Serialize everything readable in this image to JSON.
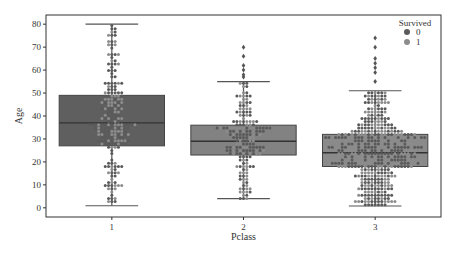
{
  "chart_data": {
    "type": "box",
    "overlay": "swarm",
    "title": "",
    "xlabel": "Pclass",
    "ylabel": "Age",
    "categories": [
      "1",
      "2",
      "3"
    ],
    "ylim": [
      -4,
      84
    ],
    "yticks": [
      0,
      10,
      20,
      30,
      40,
      50,
      60,
      70,
      80
    ],
    "grid": false,
    "boxes": [
      {
        "category": "1",
        "whisker_low": 0.9,
        "q1": 27,
        "median": 37,
        "q3": 49,
        "whisker_high": 80,
        "outliers": []
      },
      {
        "category": "2",
        "whisker_low": 4,
        "q1": 23,
        "median": 29,
        "q3": 36,
        "whisker_high": 55,
        "outliers": [
          57,
          58,
          60,
          62,
          66,
          70
        ]
      },
      {
        "category": "3",
        "whisker_low": 0.8,
        "q1": 18,
        "median": 24,
        "q3": 32,
        "whisker_high": 51,
        "outliers": [
          55,
          59,
          61,
          63,
          65,
          70,
          74
        ]
      }
    ],
    "legend": {
      "title": "Survived",
      "position": "upper right",
      "entries": [
        {
          "label": "0",
          "color": "#5a5a5a"
        },
        {
          "label": "1",
          "color": "#8c8c8c"
        }
      ]
    },
    "colors": {
      "box_1": "#5f5f5f",
      "box_2": "#828282",
      "box_3": "#8a8a8a",
      "survived_0": "#5a5a5a",
      "survived_1": "#8c8c8c"
    }
  },
  "labels": {
    "xlabel": "Pclass",
    "ylabel": "Age",
    "legend_title": "Survived",
    "legend_0": "0",
    "legend_1": "1",
    "xticks": [
      "1",
      "2",
      "3"
    ],
    "yticks": [
      "0",
      "10",
      "20",
      "30",
      "40",
      "50",
      "60",
      "70",
      "80"
    ]
  }
}
